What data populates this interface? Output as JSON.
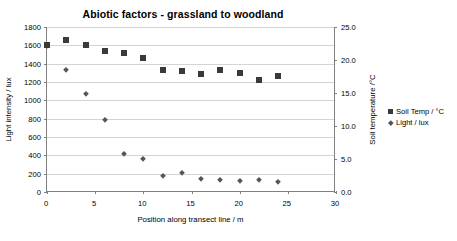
{
  "chart_data": {
    "type": "scatter",
    "title": "Abiotic factors - grassland to woodland",
    "annotation": "Group C",
    "xlabel": "Position along transect line / m",
    "ylabel": "Light intensity / lux",
    "ylabel_right": "Soil temperature /°C",
    "xlim": [
      0,
      30
    ],
    "ylim": [
      0,
      1800
    ],
    "ylim_right": [
      0.0,
      25.0
    ],
    "xticks": [
      "0",
      "5",
      "10",
      "15",
      "20",
      "25",
      "30"
    ],
    "xtick_values": [
      0,
      5,
      10,
      15,
      20,
      25,
      30
    ],
    "yticks": [
      "0",
      "200",
      "400",
      "600",
      "800",
      "1000",
      "1200",
      "1400",
      "1600",
      "1800"
    ],
    "ytick_values": [
      0,
      200,
      400,
      600,
      800,
      1000,
      1200,
      1400,
      1600,
      1800
    ],
    "yticks_right": [
      "0.0",
      "5.0",
      "10.0",
      "15.0",
      "20.0",
      "25.0"
    ],
    "ytick_values_right": [
      0.0,
      5.0,
      10.0,
      15.0,
      20.0,
      25.0
    ],
    "grid": true,
    "legend_position": "right",
    "x": [
      0,
      2,
      4,
      6,
      8,
      10,
      12,
      14,
      16,
      18,
      20,
      22,
      24
    ],
    "series": [
      {
        "name": "Soil Temp / °C",
        "axis": "right",
        "marker": "square",
        "color": "#3a3a3a",
        "values": [
          22.2,
          23.0,
          22.3,
          21.4,
          21.0,
          20.3,
          18.5,
          18.3,
          17.9,
          18.5,
          18.1,
          16.9,
          17.6
        ]
      },
      {
        "name": "Light / lux",
        "axis": "left",
        "marker": "diamond",
        "color": "#555555",
        "values": [
          1590,
          1335,
          1065,
          790,
          410,
          360,
          180,
          205,
          145,
          133,
          123,
          133,
          113
        ]
      }
    ]
  },
  "legend": {
    "items": [
      {
        "label": "Soil Temp / °C",
        "marker": "square"
      },
      {
        "label": "Light / lux",
        "marker": "diamond"
      }
    ]
  }
}
